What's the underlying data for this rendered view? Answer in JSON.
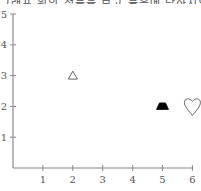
{
  "header": {
    "cutoff_text": "그래프 위의 점들을 보고 물음에 답하시오."
  },
  "chart_data": {
    "type": "scatter",
    "title": "",
    "xlabel": "",
    "ylabel": "",
    "xlim": [
      0,
      6
    ],
    "ylim": [
      0,
      5
    ],
    "x_ticks": [
      "1",
      "2",
      "3",
      "4",
      "5",
      "6"
    ],
    "y_ticks": [
      "1",
      "2",
      "3",
      "4",
      "5"
    ],
    "grid": false,
    "points": [
      {
        "x": 2,
        "y": 3,
        "marker": "triangle-open",
        "color": "#666666"
      },
      {
        "x": 5,
        "y": 2,
        "marker": "trapezoid-filled",
        "color": "#000000"
      },
      {
        "x": 6,
        "y": 2,
        "marker": "heart-open",
        "color": "#666666"
      }
    ]
  }
}
